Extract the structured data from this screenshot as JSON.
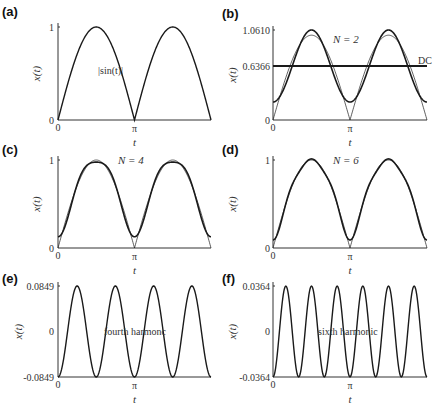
{
  "chart_data": [
    {
      "id": "a",
      "panel_label": "(a)",
      "type": "line",
      "title": "",
      "xlabel": "t",
      "ylabel": "x(t)",
      "xticks": [
        "0",
        "π"
      ],
      "yticks": [
        {
          "value": 0,
          "label": "0"
        },
        {
          "value": 1,
          "label": "1"
        }
      ],
      "xlim": [
        0,
        6.2832
      ],
      "ylim": [
        0,
        1
      ],
      "annotation": "|sin(t)|",
      "series": [
        {
          "name": "|sin(t)|",
          "function": "abs_sin",
          "width": 1.4
        }
      ]
    },
    {
      "id": "b",
      "panel_label": "(b)",
      "type": "line",
      "xlabel": "t",
      "ylabel": "x(t)",
      "xticks": [
        "0",
        "π"
      ],
      "yticks": [
        {
          "value": 0,
          "label": "0"
        },
        {
          "value": 0.6366,
          "label": "0.6366"
        },
        {
          "value": 1.061,
          "label": "1.0610"
        }
      ],
      "xlim": [
        0,
        6.2832
      ],
      "ylim": [
        0,
        1.061
      ],
      "annotation": "N = 2",
      "dc_label": "DC",
      "dc_value": 0.6366,
      "series": [
        {
          "name": "|sin(t)|",
          "function": "abs_sin",
          "width": 0.7
        },
        {
          "name": "Fourier approx N=2",
          "function": "fourier",
          "N": 2,
          "width": 1.6
        },
        {
          "name": "DC",
          "function": "const",
          "value": 0.6366,
          "width": 1.8
        }
      ]
    },
    {
      "id": "c",
      "panel_label": "(c)",
      "type": "line",
      "xlabel": "t",
      "ylabel": "x(t)",
      "xticks": [
        "0",
        "π"
      ],
      "yticks": [
        {
          "value": 0,
          "label": "0"
        },
        {
          "value": 1,
          "label": "1"
        }
      ],
      "xlim": [
        0,
        6.2832
      ],
      "ylim": [
        0,
        1
      ],
      "annotation": "N = 4",
      "series": [
        {
          "name": "|sin(t)|",
          "function": "abs_sin",
          "width": 0.7
        },
        {
          "name": "Fourier approx N=4",
          "function": "fourier",
          "N": 4,
          "width": 1.6
        }
      ]
    },
    {
      "id": "d",
      "panel_label": "(d)",
      "type": "line",
      "xlabel": "t",
      "ylabel": "x(t)",
      "xticks": [
        "0",
        "π"
      ],
      "yticks": [
        {
          "value": 0,
          "label": "0"
        },
        {
          "value": 1,
          "label": "1"
        }
      ],
      "xlim": [
        0,
        6.2832
      ],
      "ylim": [
        0,
        1
      ],
      "annotation": "N = 6",
      "series": [
        {
          "name": "|sin(t)|",
          "function": "abs_sin",
          "width": 0.7
        },
        {
          "name": "Fourier approx N=6",
          "function": "fourier",
          "N": 6,
          "width": 1.6
        }
      ]
    },
    {
      "id": "e",
      "panel_label": "(e)",
      "type": "line",
      "xlabel": "t",
      "ylabel": "x(t)",
      "xticks": [
        "0",
        "π"
      ],
      "yticks": [
        {
          "value": -0.0849,
          "label": "-0.0849"
        },
        {
          "value": 0,
          "label": "0"
        },
        {
          "value": 0.0849,
          "label": "0.0849"
        }
      ],
      "xlim": [
        0,
        6.2832
      ],
      "ylim": [
        -0.0849,
        0.0849
      ],
      "annotation": "fourth harmonc",
      "series": [
        {
          "name": "fourth harmonic",
          "function": "harmonic",
          "k": 4,
          "amplitude": 0.0849,
          "width": 1.4
        }
      ]
    },
    {
      "id": "f",
      "panel_label": "(f)",
      "type": "line",
      "xlabel": "t",
      "ylabel": "x(t)",
      "xticks": [
        "0",
        "π"
      ],
      "yticks": [
        {
          "value": -0.0364,
          "label": "-0.0364"
        },
        {
          "value": 0,
          "label": "0"
        },
        {
          "value": 0.0364,
          "label": "0.0364"
        }
      ],
      "xlim": [
        0,
        6.2832
      ],
      "ylim": [
        -0.0364,
        0.0364
      ],
      "annotation": "sixth harmonic",
      "series": [
        {
          "name": "sixth harmonic",
          "function": "harmonic",
          "k": 6,
          "amplitude": 0.0364,
          "width": 1.4
        }
      ]
    }
  ],
  "layout": {
    "panels": {
      "a": {
        "x0": 58,
        "x1": 211,
        "ybot": 120,
        "ytop": 27,
        "label_x": 2,
        "label_y": 16,
        "ann_x": 98,
        "ann_y": 74,
        "ytick_x": 54,
        "yl_x": 38
      },
      "b": {
        "x0": 273,
        "x1": 427,
        "ybot": 120,
        "ytop": 30,
        "label_x": 222,
        "label_y": 18,
        "ann_x": 333,
        "ann_y": 43,
        "ytick_x": 270,
        "yl_x": 232,
        "dc_x": 418,
        "dc_y": 64
      },
      "c": {
        "x0": 58,
        "x1": 211,
        "ybot": 248,
        "ytop": 160,
        "label_x": 2,
        "label_y": 154,
        "ann_x": 118,
        "ann_y": 164,
        "ytick_x": 54,
        "yl_x": 38
      },
      "d": {
        "x0": 273,
        "x1": 427,
        "ybot": 248,
        "ytop": 160,
        "label_x": 222,
        "label_y": 154,
        "ann_x": 333,
        "ann_y": 164,
        "ytick_x": 270,
        "yl_x": 232
      },
      "e": {
        "x0": 58,
        "x1": 211,
        "ybot": 377,
        "ytop": 286,
        "label_x": 2,
        "label_y": 283,
        "ann_x": 104,
        "ann_y": 335,
        "ytick_x": 54,
        "yl_x": 16
      },
      "f": {
        "x0": 273,
        "x1": 427,
        "ybot": 377,
        "ytop": 286,
        "label_x": 222,
        "label_y": 283,
        "ann_x": 318,
        "ann_y": 335,
        "ytick_x": 270,
        "yl_x": 232
      }
    },
    "line_color": "#1a1a1a",
    "axis_color": "#333333"
  }
}
